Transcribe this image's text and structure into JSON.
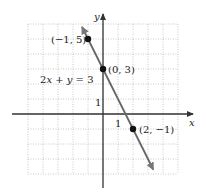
{
  "chart_data": {
    "type": "line",
    "title": "",
    "equation": "2x + y = 3",
    "xlabel": "x",
    "ylabel": "y",
    "xlim": [
      -5,
      5
    ],
    "ylim": [
      -4,
      6
    ],
    "grid": true,
    "tick_labels": {
      "x": "1",
      "y": "1"
    },
    "series": [
      {
        "name": "2x + y = 3",
        "x": [
          -1,
          0,
          2
        ],
        "y": [
          5,
          3,
          -1
        ]
      }
    ],
    "points": [
      {
        "x": -1,
        "y": 5,
        "label": "(−1, 5)"
      },
      {
        "x": 0,
        "y": 3,
        "label": "(0, 3)"
      },
      {
        "x": 2,
        "y": -1,
        "label": "(2, −1)"
      }
    ],
    "line_color": "#666666",
    "axis_color": "#333333",
    "grid_color": "#bbbbbb"
  }
}
